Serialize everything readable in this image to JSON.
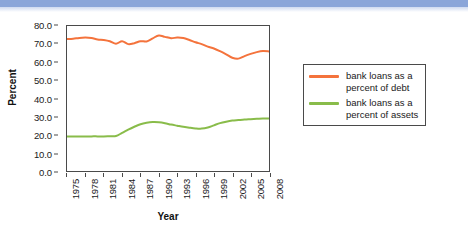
{
  "figure": {
    "background_color": "#ffffff",
    "top_band_color": "#8ba6d9",
    "frame_color": "#4a4a4a"
  },
  "chart_data": {
    "type": "line",
    "title": "",
    "xlabel": "Year",
    "ylabel": "Percent",
    "xlim": [
      1975,
      2008
    ],
    "ylim": [
      0.0,
      80.0
    ],
    "grid": false,
    "legend_position": "right",
    "x_tick_labels": [
      "1975",
      "1978",
      "1981",
      "1984",
      "1987",
      "1990",
      "1993",
      "1996",
      "1999",
      "2002",
      "2005",
      "2008"
    ],
    "x_tick_values": [
      1975,
      1978,
      1981,
      1984,
      1987,
      1990,
      1993,
      1996,
      1999,
      2002,
      2005,
      2008
    ],
    "y_tick_labels": [
      "0.0",
      "10.0",
      "20.0",
      "30.0",
      "40.0",
      "50.0",
      "60.0",
      "70.0",
      "80.0"
    ],
    "y_tick_values": [
      0.0,
      10.0,
      20.0,
      30.0,
      40.0,
      50.0,
      60.0,
      70.0,
      80.0
    ],
    "x": [
      1975,
      1976,
      1977,
      1978,
      1979,
      1980,
      1981,
      1982,
      1983,
      1984,
      1985,
      1986,
      1987,
      1988,
      1989,
      1990,
      1991,
      1992,
      1993,
      1994,
      1995,
      1996,
      1997,
      1998,
      1999,
      2000,
      2001,
      2002,
      2003,
      2004,
      2005,
      2006,
      2007,
      2008
    ],
    "series": [
      {
        "name": "bank loans as a percent of debt",
        "color": "#f4733c",
        "values": [
          72.8,
          73.0,
          73.4,
          73.6,
          73.4,
          72.6,
          72.3,
          71.6,
          70.2,
          71.6,
          70.0,
          70.5,
          71.6,
          71.5,
          73.2,
          74.8,
          74.0,
          73.3,
          73.6,
          73.4,
          72.3,
          71.0,
          70.0,
          68.6,
          67.6,
          66.1,
          64.4,
          62.5,
          62.0,
          63.4,
          64.6,
          65.6,
          66.2,
          66.0
        ]
      },
      {
        "name": "bank loans as a percent of assets",
        "color": "#89bc4a",
        "values": [
          19.1,
          19.0,
          19.0,
          19.0,
          19.1,
          19.1,
          19.1,
          19.2,
          19.3,
          21.0,
          22.8,
          24.4,
          25.8,
          26.6,
          27.0,
          26.9,
          26.4,
          25.6,
          25.0,
          24.4,
          23.9,
          23.5,
          23.4,
          24.0,
          25.2,
          26.4,
          27.2,
          27.8,
          28.1,
          28.4,
          28.6,
          28.8,
          29.0,
          29.0
        ]
      }
    ]
  },
  "legend": {
    "entries": [
      {
        "label_line1": "bank loans as a",
        "label_line2": "percent of debt",
        "color": "#f4733c"
      },
      {
        "label_line1": "bank loans as a",
        "label_line2": "percent of assets",
        "color": "#89bc4a"
      }
    ]
  }
}
